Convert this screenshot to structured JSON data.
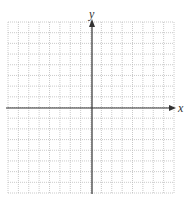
{
  "graph": {
    "x_axis_label": "x",
    "y_axis_label": "y",
    "grid": {
      "columns": 16,
      "rows": 16,
      "left": 8,
      "top": 22,
      "right": 174,
      "bottom": 193
    },
    "origin_px": {
      "x": 92,
      "y": 108
    },
    "colors": {
      "grid": "#bdbdbd",
      "axis": "#333333",
      "background": "#ffffff"
    }
  },
  "chart_data": {
    "type": "scatter",
    "title": "",
    "xlabel": "x",
    "ylabel": "y",
    "xlim": [
      -8,
      8
    ],
    "ylim": [
      -8,
      8
    ],
    "grid": true,
    "series": []
  }
}
